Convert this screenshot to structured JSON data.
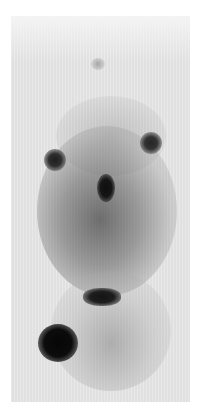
{
  "image": {
    "description": "Two-dimensional thin-layer chromatography autoradiograph",
    "background_color": "#ffffff",
    "plate_color": "#e4e4e4",
    "spots": [
      {
        "name": "faint-top-spot",
        "cx": 97,
        "cy": 64
      },
      {
        "name": "left-spot",
        "cx": 55,
        "cy": 160
      },
      {
        "name": "right-spot",
        "cx": 151,
        "cy": 143
      },
      {
        "name": "center-spot",
        "cx": 106,
        "cy": 188
      },
      {
        "name": "horizontal-band",
        "cx": 102,
        "cy": 297
      },
      {
        "name": "large-dark-spot",
        "cx": 58,
        "cy": 343
      }
    ]
  }
}
